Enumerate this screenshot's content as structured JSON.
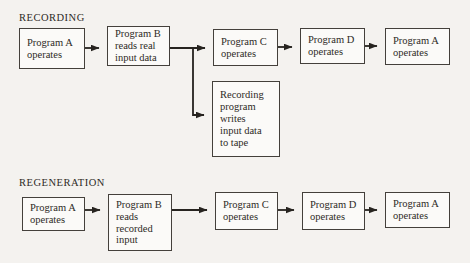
{
  "colors": {
    "background": "#f4f2ef",
    "box-fill": "#fbfaf8",
    "box-border": "#44403b",
    "ink": "#26231f",
    "text": "#2e2a26"
  },
  "recording": {
    "title": "RECORDING",
    "boxes": [
      {
        "label": "Program A\noperates"
      },
      {
        "label": "Program B\nreads real\ninput data"
      },
      {
        "label": "Program C\noperates"
      },
      {
        "label": "Program D\noperates"
      },
      {
        "label": "Program A\noperates"
      }
    ],
    "tape_box": {
      "label": "Recording\nprogram\nwrites\ninput data\nto tape"
    }
  },
  "regeneration": {
    "title": "REGENERATION",
    "boxes": [
      {
        "label": "Program A\noperates"
      },
      {
        "label": "Program B\nreads\nrecorded\ninput"
      },
      {
        "label": "Program C\noperates"
      },
      {
        "label": "Program D\noperates"
      },
      {
        "label": "Program A\noperates"
      }
    ]
  }
}
